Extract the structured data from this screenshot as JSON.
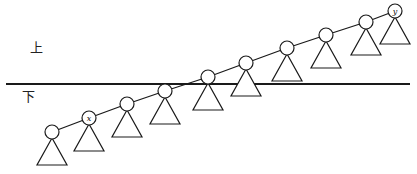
{
  "diagram": {
    "regions": {
      "upper_label": "上",
      "lower_label": "下"
    },
    "divider": {
      "x1": 6,
      "x2": 410,
      "y": 84
    },
    "spine_nodes": [
      {
        "cx": 52,
        "cy": 132,
        "label": ""
      },
      {
        "cx": 89,
        "cy": 118,
        "label": "x"
      },
      {
        "cx": 127,
        "cy": 104,
        "label": ""
      },
      {
        "cx": 165,
        "cy": 91,
        "label": ""
      },
      {
        "cx": 208,
        "cy": 77,
        "label": ""
      },
      {
        "cx": 246,
        "cy": 63,
        "label": ""
      },
      {
        "cx": 287,
        "cy": 48,
        "label": ""
      },
      {
        "cx": 326,
        "cy": 35,
        "label": ""
      },
      {
        "cx": 366,
        "cy": 22,
        "label": ""
      },
      {
        "cx": 395,
        "cy": 11,
        "label": "y"
      }
    ],
    "subtree_height": 33,
    "subtree_half_width": 15,
    "node_radius": 7,
    "colors": {
      "stroke": "#1a1a1a",
      "background": "#ffffff"
    }
  }
}
